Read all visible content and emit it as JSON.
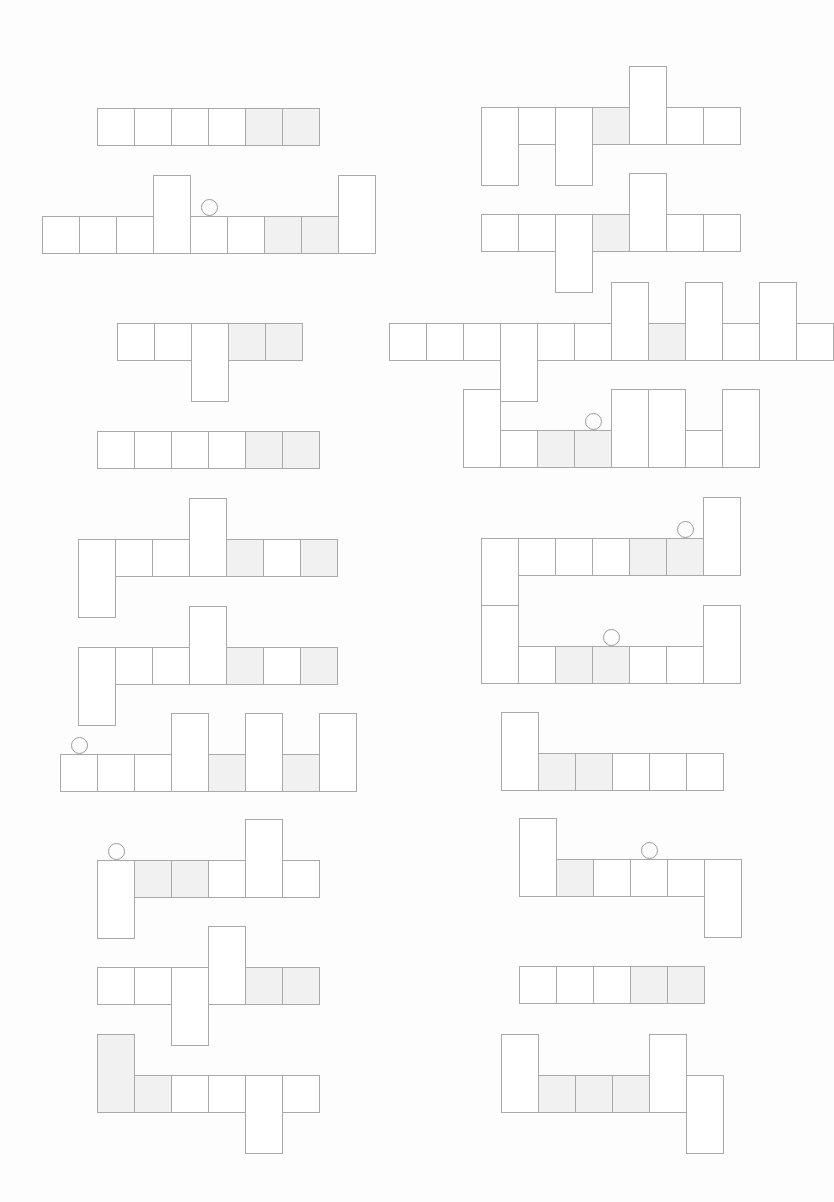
{
  "page": {
    "background": "#fdfdfd",
    "line_color": "#a9a9a9",
    "shade_color": "#f1f1f1",
    "cell_width": 37,
    "cell_height": 37
  },
  "figures": [
    {
      "id": "L1",
      "x": 97,
      "y": 108,
      "cells": [
        {
          "t": "n"
        },
        {
          "t": "n"
        },
        {
          "t": "n"
        },
        {
          "t": "n"
        },
        {
          "t": "n",
          "s": 1
        },
        {
          "t": "n",
          "s": 1
        }
      ]
    },
    {
      "id": "L2",
      "x": 42,
      "y": 216,
      "marker": 4,
      "cells": [
        {
          "t": "n"
        },
        {
          "t": "n"
        },
        {
          "t": "n"
        },
        {
          "t": "u"
        },
        {
          "t": "n"
        },
        {
          "t": "n"
        },
        {
          "t": "n",
          "s": 1
        },
        {
          "t": "n",
          "s": 1
        },
        {
          "t": "u"
        }
      ]
    },
    {
      "id": "L3",
      "x": 117,
      "y": 323,
      "cells": [
        {
          "t": "n"
        },
        {
          "t": "n"
        },
        {
          "t": "d"
        },
        {
          "t": "n",
          "s": 1
        },
        {
          "t": "n",
          "s": 1
        }
      ]
    },
    {
      "id": "L4",
      "x": 97,
      "y": 431,
      "cells": [
        {
          "t": "n"
        },
        {
          "t": "n"
        },
        {
          "t": "n"
        },
        {
          "t": "n"
        },
        {
          "t": "n",
          "s": 1
        },
        {
          "t": "n",
          "s": 1
        }
      ]
    },
    {
      "id": "L5",
      "x": 78,
      "y": 539,
      "cells": [
        {
          "t": "d"
        },
        {
          "t": "n"
        },
        {
          "t": "n"
        },
        {
          "t": "u"
        },
        {
          "t": "n",
          "s": 1
        },
        {
          "t": "n"
        },
        {
          "t": "n",
          "s": 1
        }
      ]
    },
    {
      "id": "L6",
      "x": 78,
      "y": 647,
      "cells": [
        {
          "t": "d"
        },
        {
          "t": "n"
        },
        {
          "t": "n"
        },
        {
          "t": "u"
        },
        {
          "t": "n",
          "s": 1
        },
        {
          "t": "n"
        },
        {
          "t": "n",
          "s": 1
        }
      ]
    },
    {
      "id": "L7",
      "x": 60,
      "y": 754,
      "marker": 0,
      "cells": [
        {
          "t": "n"
        },
        {
          "t": "n"
        },
        {
          "t": "n"
        },
        {
          "t": "u"
        },
        {
          "t": "n",
          "s": 1
        },
        {
          "t": "u"
        },
        {
          "t": "n",
          "s": 1
        },
        {
          "t": "u"
        }
      ]
    },
    {
      "id": "L8",
      "x": 97,
      "y": 860,
      "marker": 0,
      "cells": [
        {
          "t": "d"
        },
        {
          "t": "n",
          "s": 1
        },
        {
          "t": "n",
          "s": 1
        },
        {
          "t": "n"
        },
        {
          "t": "u"
        },
        {
          "t": "n"
        }
      ]
    },
    {
      "id": "L9",
      "x": 97,
      "y": 967,
      "cells": [
        {
          "t": "n"
        },
        {
          "t": "n"
        },
        {
          "t": "d"
        },
        {
          "t": "u"
        },
        {
          "t": "n",
          "s": 1
        },
        {
          "t": "n",
          "s": 1
        }
      ]
    },
    {
      "id": "L10",
      "x": 97,
      "y": 1075,
      "cells": [
        {
          "t": "u",
          "s": 1
        },
        {
          "t": "n",
          "s": 1
        },
        {
          "t": "n"
        },
        {
          "t": "n"
        },
        {
          "t": "d"
        },
        {
          "t": "n"
        }
      ]
    },
    {
      "id": "R1",
      "x": 481,
      "y": 107,
      "cells": [
        {
          "t": "d"
        },
        {
          "t": "n"
        },
        {
          "t": "d"
        },
        {
          "t": "n",
          "s": 1
        },
        {
          "t": "u"
        },
        {
          "t": "n"
        },
        {
          "t": "n"
        }
      ]
    },
    {
      "id": "R2",
      "x": 481,
      "y": 214,
      "cells": [
        {
          "t": "n"
        },
        {
          "t": "n"
        },
        {
          "t": "d"
        },
        {
          "t": "n",
          "s": 1
        },
        {
          "t": "u"
        },
        {
          "t": "n"
        },
        {
          "t": "n"
        }
      ]
    },
    {
      "id": "R3",
      "x": 389,
      "y": 323,
      "cells": [
        {
          "t": "n"
        },
        {
          "t": "n"
        },
        {
          "t": "n"
        },
        {
          "t": "d"
        },
        {
          "t": "n"
        },
        {
          "t": "n"
        },
        {
          "t": "u"
        },
        {
          "t": "n",
          "s": 1
        },
        {
          "t": "u"
        },
        {
          "t": "n"
        },
        {
          "t": "u"
        },
        {
          "t": "n"
        }
      ]
    },
    {
      "id": "R4",
      "x": 463,
      "y": 430,
      "marker": 3,
      "cells": [
        {
          "t": "u"
        },
        {
          "t": "n"
        },
        {
          "t": "n",
          "s": 1
        },
        {
          "t": "n",
          "s": 1
        },
        {
          "t": "u"
        },
        {
          "t": "u"
        },
        {
          "t": "n"
        },
        {
          "t": "u"
        }
      ]
    },
    {
      "id": "R5",
      "x": 481,
      "y": 538,
      "marker": 5,
      "cells": [
        {
          "t": "d"
        },
        {
          "t": "n"
        },
        {
          "t": "n"
        },
        {
          "t": "n"
        },
        {
          "t": "n",
          "s": 1
        },
        {
          "t": "n",
          "s": 1
        },
        {
          "t": "u"
        }
      ]
    },
    {
      "id": "R6",
      "x": 481,
      "y": 646,
      "marker": 3,
      "cells": [
        {
          "t": "u"
        },
        {
          "t": "n"
        },
        {
          "t": "n",
          "s": 1
        },
        {
          "t": "n",
          "s": 1
        },
        {
          "t": "n"
        },
        {
          "t": "n"
        },
        {
          "t": "u"
        }
      ]
    },
    {
      "id": "R7",
      "x": 501,
      "y": 753,
      "cells": [
        {
          "t": "u"
        },
        {
          "t": "n",
          "s": 1
        },
        {
          "t": "n",
          "s": 1
        },
        {
          "t": "n"
        },
        {
          "t": "n"
        },
        {
          "t": "n"
        }
      ]
    },
    {
      "id": "R8",
      "x": 519,
      "y": 859,
      "marker": 3,
      "cells": [
        {
          "t": "u"
        },
        {
          "t": "n",
          "s": 1
        },
        {
          "t": "n"
        },
        {
          "t": "n"
        },
        {
          "t": "n"
        },
        {
          "t": "d"
        }
      ]
    },
    {
      "id": "R9",
      "x": 519,
      "y": 966,
      "cells": [
        {
          "t": "n"
        },
        {
          "t": "n"
        },
        {
          "t": "n"
        },
        {
          "t": "n",
          "s": 1
        },
        {
          "t": "n",
          "s": 1
        }
      ]
    },
    {
      "id": "R10",
      "x": 501,
      "y": 1075,
      "cells": [
        {
          "t": "u"
        },
        {
          "t": "n",
          "s": 1
        },
        {
          "t": "n",
          "s": 1
        },
        {
          "t": "n",
          "s": 1
        },
        {
          "t": "u"
        },
        {
          "t": "d"
        }
      ]
    }
  ]
}
